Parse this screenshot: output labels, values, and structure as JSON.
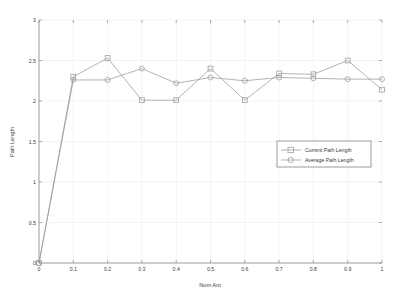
{
  "chart_data": {
    "type": "line",
    "title": "",
    "xlabel": "Num Ant",
    "ylabel": "Path Length",
    "xlim": [
      0,
      1
    ],
    "ylim": [
      0,
      3
    ],
    "grid": true,
    "legend_position": "center-right",
    "x": [
      0,
      0.1,
      0.2,
      0.3,
      0.4,
      0.5,
      0.6,
      0.7,
      0.8,
      0.9,
      1
    ],
    "xticks": [
      "0",
      "0.1",
      "0.2",
      "0.3",
      "0.4",
      "0.5",
      "0.6",
      "0.7",
      "0.8",
      "0.9",
      "1"
    ],
    "yticks": [
      "0",
      "0.5",
      "1",
      "1.5",
      "2",
      "2.5",
      "3"
    ],
    "ytick_values": [
      0,
      0.5,
      1,
      1.5,
      2,
      2.5,
      3
    ],
    "series": [
      {
        "name": "Current Path Length",
        "marker": "square",
        "color": "#9a9a9a",
        "values": [
          0,
          2.3,
          2.53,
          2.01,
          2.01,
          2.4,
          2.01,
          2.34,
          2.33,
          2.5,
          2.14
        ]
      },
      {
        "name": "Average Path Length",
        "marker": "circle",
        "color": "#9a9a9a",
        "values": [
          0,
          2.26,
          2.26,
          2.4,
          2.22,
          2.29,
          2.25,
          2.29,
          2.28,
          2.27,
          2.27
        ]
      }
    ]
  },
  "legend": {
    "entries": [
      {
        "label": "Current Path Length",
        "marker": "square"
      },
      {
        "label": "Average Path Length",
        "marker": "circle"
      }
    ]
  },
  "axes": {
    "x_title": "Num Ant",
    "y_title": "Path Length"
  },
  "colors": {
    "series": "#9a9a9a",
    "axis": "#8a8a8a",
    "grid": "#ededed",
    "text": "#3a3a3a",
    "background": "#ffffff"
  }
}
